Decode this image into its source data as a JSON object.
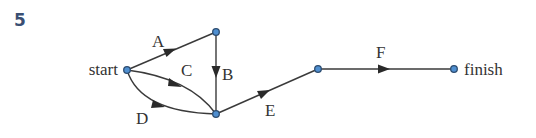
{
  "question_number": "5",
  "diagram": {
    "type": "activity-network",
    "nodes": [
      {
        "id": "start",
        "label": "start",
        "x": 127,
        "y": 70
      },
      {
        "id": "n2",
        "label": "",
        "x": 216,
        "y": 32
      },
      {
        "id": "n3",
        "label": "",
        "x": 216,
        "y": 114
      },
      {
        "id": "n4",
        "label": "",
        "x": 318,
        "y": 69
      },
      {
        "id": "finish",
        "label": "finish",
        "x": 454,
        "y": 69
      }
    ],
    "edges": [
      {
        "label": "A",
        "from": "start",
        "to": "n2"
      },
      {
        "label": "B",
        "from": "n2",
        "to": "n3"
      },
      {
        "label": "C",
        "from": "start",
        "to": "n3"
      },
      {
        "label": "D",
        "from": "start",
        "to": "n3"
      },
      {
        "label": "E",
        "from": "n3",
        "to": "n4"
      },
      {
        "label": "F",
        "from": "n4",
        "to": "finish"
      }
    ],
    "colors": {
      "node_fill": "#4f8fd0",
      "node_stroke": "#2c4c70",
      "edge": "#3a3a3a",
      "number": "#3b4f73"
    }
  }
}
